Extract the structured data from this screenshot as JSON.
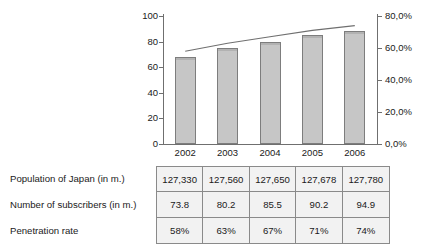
{
  "chart_data": {
    "type": "bar",
    "title": "",
    "subtitle": "",
    "xlabel": "",
    "ylabel": "",
    "categories": [
      "2002",
      "2003",
      "2004",
      "2005",
      "2006"
    ],
    "series": [
      {
        "name": "Number of subscribers (in m.)",
        "type": "bar",
        "axis": "left",
        "values": [
          68,
          75,
          80,
          85.5,
          88.5
        ],
        "color": "#c6c6c6"
      },
      {
        "name": "Penetration rate",
        "type": "line",
        "axis": "right",
        "values": [
          58,
          63,
          67,
          71,
          74
        ],
        "color": "#6f6f6f"
      }
    ],
    "left_axis": {
      "ticks": [
        "0",
        "20",
        "40",
        "60",
        "80",
        "100"
      ],
      "values": [
        0,
        20,
        40,
        60,
        80,
        100
      ],
      "ylim": [
        0,
        100
      ]
    },
    "right_axis": {
      "ticks": [
        "0,0%",
        "20,0%",
        "40,0%",
        "60,0%",
        "80,0%"
      ],
      "values": [
        0,
        20,
        40,
        60,
        80
      ],
      "ylim": [
        0,
        80
      ]
    },
    "grid": false,
    "legend": "none"
  },
  "table": {
    "rows": [
      {
        "label": "Population of Japan (in m.)",
        "values": [
          "127,330",
          "127,560",
          "127,650",
          "127,678",
          "127,780"
        ]
      },
      {
        "label": "Number of subscribers (in m.)",
        "values": [
          "73.8",
          "80.2",
          "85.5",
          "90.2",
          "94.9"
        ]
      },
      {
        "label": "Penetration rate",
        "values": [
          "58%",
          "63%",
          "67%",
          "71%",
          "74%"
        ]
      }
    ]
  },
  "colors": {
    "bar_fill": "#c6c6c6",
    "bar_stroke": "#7d7d7d",
    "line": "#6f6f6f",
    "axis": "#6f6f6f",
    "table_border": "#8a8a8a",
    "table_cell_bg": "#f2f2f2",
    "text": "#1a1a1a"
  }
}
